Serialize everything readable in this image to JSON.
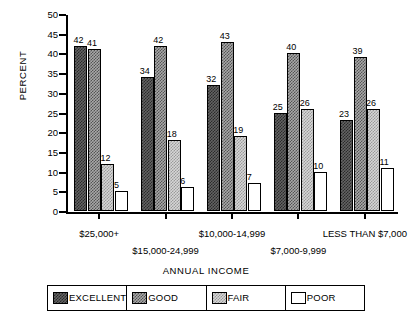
{
  "chart_data": {
    "type": "bar",
    "title": "",
    "xlabel": "ANNUAL INCOME",
    "ylabel": "PERCENT",
    "ylim": [
      0,
      50
    ],
    "ytick_step": 5,
    "yticks": [
      "50",
      "45",
      "40",
      "35",
      "30",
      "25",
      "20",
      "15",
      "10",
      "5",
      "0"
    ],
    "grid": false,
    "legend_position": "bottom",
    "categories": [
      "$25,000+",
      "$15,000-24,999",
      "$10,000-14,999",
      "$7,000-9,999",
      "LESS THAN $7,000"
    ],
    "series": [
      {
        "name": "EXCELLENT",
        "values": [
          42,
          34,
          32,
          25,
          23
        ]
      },
      {
        "name": "GOOD",
        "values": [
          41,
          42,
          43,
          40,
          39
        ]
      },
      {
        "name": "FAIR",
        "values": [
          12,
          18,
          19,
          26,
          26
        ]
      },
      {
        "name": "POOR",
        "values": [
          5,
          6,
          7,
          10,
          11
        ]
      }
    ]
  },
  "legend": {
    "items": [
      {
        "label": "EXCELLENT",
        "swatch": "dark-hatch"
      },
      {
        "label": "GOOD",
        "swatch": "medium-hatch"
      },
      {
        "label": "FAIR",
        "swatch": "light-hatch"
      },
      {
        "label": "POOR",
        "swatch": "white"
      }
    ]
  }
}
